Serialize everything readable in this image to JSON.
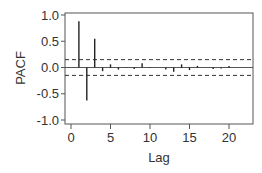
{
  "chart_data": {
    "type": "bar",
    "subtype": "pacf-stem",
    "title": "",
    "xlabel": "Lag",
    "ylabel": "PACF",
    "xlim": [
      -1,
      23
    ],
    "ylim": [
      -1.1,
      1.1
    ],
    "x_ticks": [
      0,
      5,
      10,
      15,
      20
    ],
    "x_tick_labels": [
      "0",
      "5",
      "10",
      "15",
      "20"
    ],
    "y_ticks": [
      1.0,
      0.5,
      0.0,
      -0.5,
      -1.0
    ],
    "y_tick_labels": [
      "1.0",
      "0.5",
      "0.0",
      "-0.5",
      "-1.0"
    ],
    "grid": false,
    "legend": null,
    "confidence_bounds": [
      0.15,
      -0.15
    ],
    "lags": [
      1,
      2,
      3,
      4,
      5,
      6,
      7,
      8,
      9,
      10,
      11,
      12,
      13,
      14,
      15,
      16,
      17,
      18,
      19,
      20
    ],
    "values": [
      0.88,
      -0.63,
      0.55,
      -0.07,
      0.06,
      -0.04,
      0.01,
      -0.03,
      0.08,
      0.01,
      0.0,
      -0.04,
      -0.08,
      0.06,
      -0.05,
      0.03,
      0.0,
      -0.03,
      -0.02,
      0.03
    ]
  },
  "colors": {
    "stem": "#222222",
    "axis": "#555555",
    "bounds": "#333333",
    "text": "#333333"
  }
}
